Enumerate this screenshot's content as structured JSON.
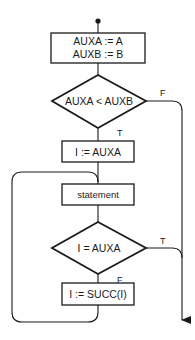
{
  "diagram": {
    "type": "flowchart",
    "colors": {
      "stroke": "#1a1a1a",
      "background": "#ffffff"
    },
    "nodes": {
      "start": {
        "kind": "entry-dot"
      },
      "init": {
        "kind": "process",
        "lines": [
          "AUXA := A",
          "AUXB := B"
        ]
      },
      "cond1": {
        "kind": "decision",
        "label": "AUXA < AUXB"
      },
      "assign": {
        "kind": "process",
        "label": "I := AUXA"
      },
      "stmt": {
        "kind": "process",
        "label": "statement"
      },
      "cond2": {
        "kind": "decision",
        "label": "I = AUXA"
      },
      "succ": {
        "kind": "process",
        "label": "I := SUCC(I)"
      },
      "exit": {
        "kind": "exit-arrow"
      }
    },
    "edges": {
      "cond1_true": "T",
      "cond1_false": "F",
      "cond2_true": "T",
      "cond2_false": "F"
    }
  }
}
